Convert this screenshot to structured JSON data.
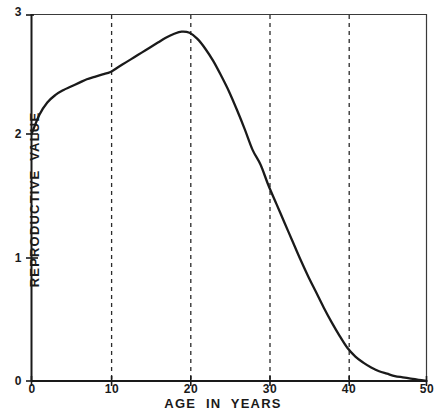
{
  "chart_data": {
    "type": "line",
    "title": "",
    "xlabel": "AGE IN YEARS",
    "ylabel": "REPRODUCTIVE VALUE",
    "xlim": [
      0,
      50
    ],
    "ylim": [
      0,
      3
    ],
    "xticks": [
      0,
      10,
      20,
      30,
      40,
      50
    ],
    "xtick_labels": [
      "0",
      "10",
      "20",
      "30",
      "40",
      "50"
    ],
    "yticks": [
      0,
      1,
      2,
      3
    ],
    "ytick_labels": [
      "0",
      "1",
      "2",
      "3"
    ],
    "grid": "vertical dashed gridlines at x = 10, 20, 30, 40",
    "grid_x_values": [
      10,
      20,
      30,
      40
    ],
    "legend": "none",
    "series": [
      {
        "name": "Reproductive value",
        "line_color": "#1a1a1a",
        "x": [
          0,
          1,
          2,
          3,
          4,
          5,
          6,
          7,
          8,
          9,
          10,
          11,
          12,
          13,
          14,
          15,
          16,
          17,
          18,
          19,
          20,
          21,
          22,
          23,
          24,
          25,
          26,
          27,
          28,
          29,
          30,
          31,
          32,
          33,
          34,
          35,
          36,
          37,
          38,
          39,
          40,
          41,
          42,
          43,
          44,
          45,
          46,
          47,
          48,
          49,
          50
        ],
        "values": [
          2.02,
          2.18,
          2.28,
          2.34,
          2.38,
          2.41,
          2.44,
          2.47,
          2.49,
          2.51,
          2.53,
          2.57,
          2.61,
          2.65,
          2.69,
          2.73,
          2.77,
          2.81,
          2.84,
          2.86,
          2.85,
          2.8,
          2.72,
          2.62,
          2.5,
          2.37,
          2.22,
          2.06,
          1.89,
          1.77,
          1.6,
          1.45,
          1.3,
          1.15,
          1.0,
          0.86,
          0.73,
          0.6,
          0.48,
          0.37,
          0.27,
          0.2,
          0.15,
          0.11,
          0.08,
          0.06,
          0.04,
          0.03,
          0.02,
          0.01,
          0.0
        ]
      }
    ]
  }
}
